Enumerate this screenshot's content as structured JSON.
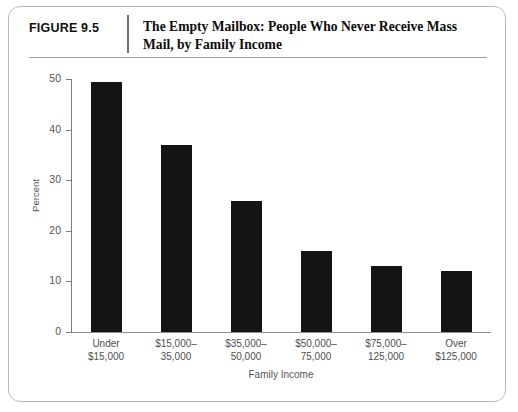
{
  "figure": {
    "number_label": "FIGURE 9.5",
    "title": "The Empty Mailbox: People Who Never Receive Mass Mail, by Family Income"
  },
  "chart_data": {
    "type": "bar",
    "title": "The Empty Mailbox: People Who Never Receive Mass Mail, by Family Income",
    "xlabel": "Family Income",
    "ylabel": "Percent",
    "ylim": [
      0,
      50
    ],
    "yticks": [
      0,
      10,
      20,
      30,
      40,
      50
    ],
    "ytick_labels": [
      "0",
      "10",
      "20",
      "30",
      "40",
      "50"
    ],
    "grid": false,
    "legend": null,
    "bar_color": "#141414",
    "categories": [
      "Under $15,000",
      "$15,000–35,000",
      "$35,000–50,000",
      "$50,000–75,000",
      "$75,000–125,000",
      "Over $125,000"
    ],
    "category_lines": [
      [
        "Under",
        "$15,000"
      ],
      [
        "$15,000–",
        "35,000"
      ],
      [
        "$35,000–",
        "50,000"
      ],
      [
        "$50,000–",
        "75,000"
      ],
      [
        "$75,000–",
        "125,000"
      ],
      [
        "Over",
        "$125,000"
      ]
    ],
    "values": [
      49.5,
      37.0,
      25.8,
      16.0,
      13.0,
      12.1
    ]
  }
}
